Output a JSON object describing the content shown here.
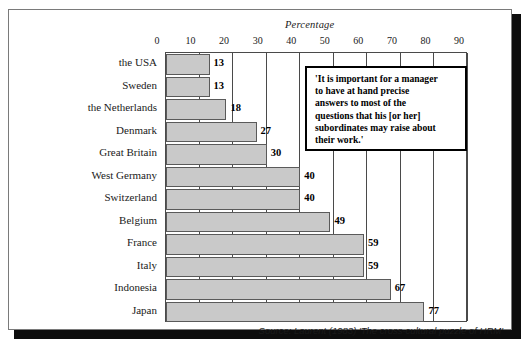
{
  "chart_data": {
    "type": "bar",
    "orientation": "horizontal",
    "title": "Percentage",
    "xlabel": "Percentage",
    "ylabel": "",
    "xlim": [
      0,
      90
    ],
    "xticks": [
      0,
      10,
      20,
      30,
      40,
      50,
      60,
      70,
      80,
      90
    ],
    "grid": true,
    "legend": null,
    "categories": [
      "the USA",
      "Sweden",
      "the Netherlands",
      "Denmark",
      "Great Britain",
      "West Germany",
      "Switzerland",
      "Belgium",
      "France",
      "Italy",
      "Indonesia",
      "Japan"
    ],
    "values": [
      13,
      13,
      18,
      27,
      30,
      40,
      40,
      49,
      59,
      59,
      67,
      77
    ],
    "value_labels": [
      "13",
      "13",
      "18",
      "27",
      "30",
      "40",
      "40",
      "49",
      "59",
      "59",
      "67",
      "77"
    ],
    "annotation": "'It is important for a manager to have at hand precise answers to most of the questions that his [or her] subordinates may raise about their work.'",
    "source": "Source: Laurent (1983) 'The cross-cultural puzzle of HRM'",
    "colors": {
      "bar_fill": "#c9c9c9",
      "bar_border": "#5a5a5a",
      "axis": "#4a4a4a",
      "text": "#1a1a1a",
      "frame": "#7a7a7a",
      "shadow": "#0d0d0d"
    }
  },
  "quote": {
    "lines": [
      "'It is important for a manager",
      "to have at hand precise",
      "answers to most of the",
      "questions that his [or her]",
      "subordinates may raise about",
      "their work.'"
    ]
  },
  "source": {
    "text": "Source: Laurent (1983) 'The cross-cultural puzzle of HRM'"
  }
}
